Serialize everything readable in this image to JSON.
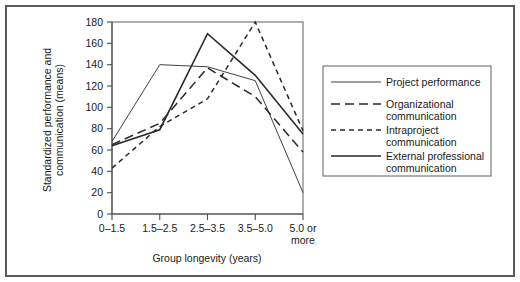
{
  "figure": {
    "frame_color": "#555b5e",
    "background": "#ffffff"
  },
  "axes": {
    "y_title_line1": "Standardized performance and",
    "y_title_line2": "communication (means)",
    "x_title": "Group longevity (years)",
    "y_ticks": [
      "0",
      "20",
      "40",
      "60",
      "80",
      "100",
      "120",
      "140",
      "160",
      "180"
    ],
    "x_ticks": [
      "0–1.5",
      "1.5–2.5",
      "2.5–3.5",
      "3.5–5.0",
      "5.0 or"
    ],
    "x_tick_last_line2": "more"
  },
  "legend": {
    "items": [
      {
        "label": "Project performance",
        "style": "solid-thin",
        "color": "#2a2a2a"
      },
      {
        "label": "Organizational",
        "label2": "communication",
        "style": "long-dash",
        "color": "#2a2a2a"
      },
      {
        "label": "Intraproject",
        "label2": "communication",
        "style": "short-dash",
        "color": "#2a2a2a"
      },
      {
        "label": "External professional",
        "label2": "communication",
        "style": "solid-thick",
        "color": "#2a2a2a"
      }
    ]
  },
  "chart_data": {
    "type": "line",
    "title": "",
    "xlabel": "Group longevity (years)",
    "ylabel": "Standardized performance and communication (means)",
    "categories": [
      "0–1.5",
      "1.5–2.5",
      "2.5–3.5",
      "3.5–5.0",
      "5.0 or more"
    ],
    "ylim": [
      0,
      180
    ],
    "ytick_step": 20,
    "grid": false,
    "legend_position": "right",
    "series": [
      {
        "name": "Project performance",
        "style": "solid-thin",
        "color": "#2a2a2a",
        "values": [
          68,
          140,
          138,
          125,
          20
        ]
      },
      {
        "name": "Organizational communication",
        "style": "long-dash",
        "color": "#2a2a2a",
        "values": [
          65,
          85,
          137,
          110,
          58
        ]
      },
      {
        "name": "Intraproject communication",
        "style": "short-dash",
        "color": "#2a2a2a",
        "values": [
          43,
          82,
          108,
          180,
          78
        ]
      },
      {
        "name": "External professional communication",
        "style": "solid-thick",
        "color": "#2a2a2a",
        "values": [
          64,
          79,
          169,
          130,
          75
        ]
      }
    ]
  }
}
